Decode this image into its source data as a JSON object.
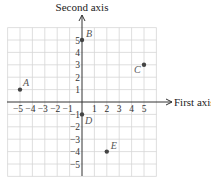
{
  "diagram": {
    "type": "coordinate-plane",
    "x_axis_label": "First axis",
    "y_axis_label": "Second axis",
    "x_ticks": [
      "−5",
      "−4",
      "−3",
      "−2",
      "−1",
      "1",
      "2",
      "3",
      "4",
      "5"
    ],
    "y_ticks": [
      "5",
      "4",
      "3",
      "2",
      "1",
      "−1",
      "−2",
      "−3",
      "−4",
      "−5"
    ],
    "grid_range": {
      "xmin": -6,
      "xmax": 6,
      "ymin": -6,
      "ymax": 6
    },
    "points": [
      {
        "label": "A",
        "x": -5,
        "y": 1
      },
      {
        "label": "B",
        "x": 0,
        "y": 5
      },
      {
        "label": "C",
        "x": 5,
        "y": 3
      },
      {
        "label": "D",
        "x": 0,
        "y": -1
      },
      {
        "label": "E",
        "x": 2,
        "y": -4
      }
    ],
    "colors": {
      "grid": "#d6d6d6",
      "axis": "#333333",
      "point": "#444444",
      "point_label": "#666666"
    }
  }
}
